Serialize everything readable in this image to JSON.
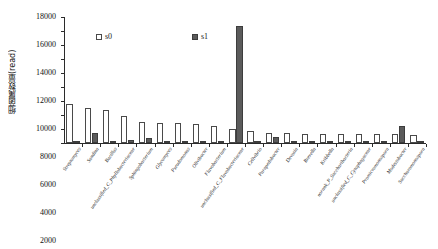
{
  "chart_data": {
    "type": "bar",
    "title": "",
    "xlabel": "",
    "ylabel": "细菌属数量(read)",
    "ylim": [
      0,
      18000
    ],
    "ytick_labels": [
      "0",
      "2000",
      "4000",
      "6000",
      "8000",
      "10000",
      "12000",
      "14000",
      "16000",
      "18000"
    ],
    "ytick_values": [
      0,
      2000,
      4000,
      6000,
      8000,
      10000,
      12000,
      14000,
      16000,
      18000
    ],
    "grid": false,
    "legend_position": "upper-center",
    "categories": [
      "Streptomyces",
      "Sandina",
      "Bacillus",
      "unclassified_C_Phyllobacteriaceae",
      "Sphingobacterium",
      "Glycomyces",
      "Pseudomonas",
      "Olivibacter",
      "Flavobacterium",
      "unclassified_C_Flavobacteriaceae",
      "Cellvibrio",
      "Parapedobacter",
      "Devosia",
      "Brevella",
      "Kribbella",
      "norank_P_Saccharibacteria",
      "unclassified_C_Cytophagaceae",
      "Promicromonospora",
      "Modestobacter",
      "Saccharomonospora"
    ],
    "series": [
      {
        "name": "s0",
        "color": "#ffffff",
        "values": [
          5600,
          5000,
          4650,
          3900,
          3050,
          2850,
          2800,
          2750,
          2500,
          2050,
          1750,
          1500,
          1400,
          1350,
          1300,
          1300,
          1300,
          1250,
          1250,
          1200
        ]
      },
      {
        "name": "s1",
        "color": "#5b5b5b",
        "values": [
          120,
          1400,
          330,
          420,
          700,
          90,
          80,
          100,
          190,
          16700,
          130,
          900,
          120,
          110,
          100,
          110,
          60,
          300,
          2400,
          110
        ]
      }
    ]
  },
  "legend": {
    "entries": [
      {
        "label": "s0"
      },
      {
        "label": "s1"
      }
    ]
  }
}
